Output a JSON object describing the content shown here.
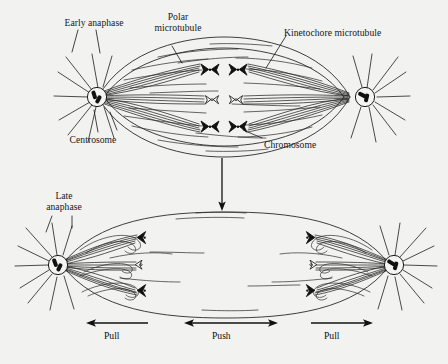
{
  "figure": {
    "title_visible": false,
    "background_color": "#f2f2f0",
    "ink_color": "#1a1a1a",
    "type": "biology-diagram"
  },
  "panels": {
    "top": {
      "name": "Early anaphase",
      "stage_label": "Early anaphase",
      "labels": {
        "polar_microtubule_line1": "Polar",
        "polar_microtubule_line2": "microtubule",
        "kinetochore_microtubule": "Kinetochore microtubule",
        "centrosome": "Centrosome",
        "chromosome": "Chromosome"
      },
      "chromosome_pairs": 3,
      "centrosomes": 2
    },
    "bottom": {
      "stage_label_line1": "Late",
      "stage_label_line2": "anaphase",
      "chromosome_groups": 2,
      "chromosomes_per_group": 3,
      "centrosomes": 2
    }
  },
  "force_arrows": [
    {
      "label": "Pull",
      "direction": "left"
    },
    {
      "label": "Push",
      "direction": "both"
    },
    {
      "label": "Pull",
      "direction": "right"
    }
  ],
  "transition": {
    "icon": "down-arrow-icon",
    "direction": "down"
  }
}
